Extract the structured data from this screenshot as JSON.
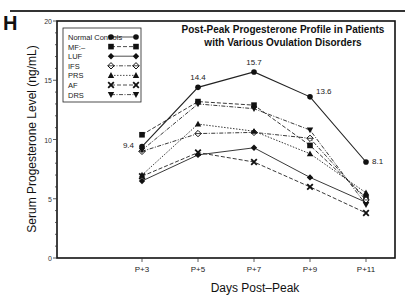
{
  "panel": {
    "letter": "H"
  },
  "chart_data": {
    "type": "line",
    "title_lines": [
      "Post-Peak Progesterone Profile in Patients",
      "with Various Ovulation Disorders"
    ],
    "xlabel": "Days Post–Peak",
    "ylabel": "Serum Progesterone Level (ng/mL)",
    "categories": [
      "P+3",
      "P+5",
      "P+7",
      "P+9",
      "P+11"
    ],
    "ylim": [
      0,
      20
    ],
    "yticks": [
      0,
      5,
      10,
      15,
      20
    ],
    "grid": false,
    "legend_position": "upper-left inside",
    "series": [
      {
        "name": "Normal Controls",
        "marker": "circle",
        "dash": "solid",
        "values": [
          9.4,
          14.4,
          15.7,
          13.6,
          8.1
        ]
      },
      {
        "name": "MF:–",
        "marker": "square",
        "dash": "dashed",
        "values": [
          10.4,
          13.2,
          12.9,
          9.5,
          5.1
        ]
      },
      {
        "name": "LUF",
        "marker": "diamond",
        "dash": "solid",
        "values": [
          6.5,
          8.7,
          9.3,
          6.8,
          4.7
        ]
      },
      {
        "name": "IFS",
        "marker": "diamond-open",
        "dash": "dashdot",
        "values": [
          9.0,
          10.5,
          10.6,
          10.1,
          4.9
        ]
      },
      {
        "name": "PRS",
        "marker": "triangle-up",
        "dash": "dotted",
        "values": [
          7.0,
          11.3,
          10.7,
          8.8,
          5.5
        ]
      },
      {
        "name": "AF",
        "marker": "x",
        "dash": "dashed",
        "values": [
          6.9,
          8.9,
          8.1,
          6.0,
          3.8
        ]
      },
      {
        "name": "DRS",
        "marker": "triangle-down",
        "dash": "dashdot",
        "values": [
          9.1,
          13.0,
          12.6,
          10.8,
          4.5
        ]
      }
    ],
    "annotations": [
      {
        "series": "Normal Controls",
        "x": "P+3",
        "text": "9.4"
      },
      {
        "series": "Normal Controls",
        "x": "P+5",
        "text": "14.4"
      },
      {
        "series": "Normal Controls",
        "x": "P+7",
        "text": "15.7"
      },
      {
        "series": "Normal Controls",
        "x": "P+9",
        "text": "13.6"
      },
      {
        "series": "Normal Controls",
        "x": "P+11",
        "text": "8.1"
      }
    ]
  }
}
